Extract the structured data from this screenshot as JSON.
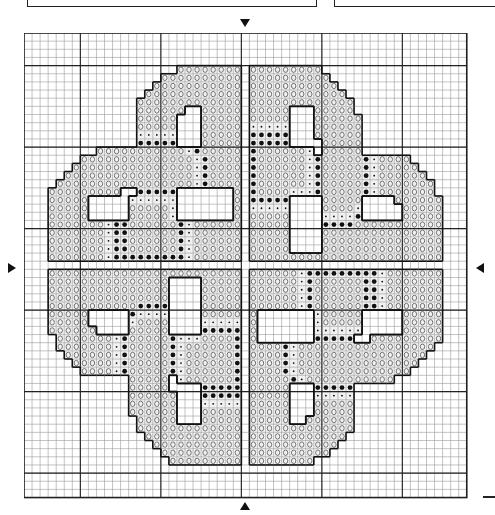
{
  "pattern": {
    "title": "",
    "grid": {
      "cols": 55,
      "rows": 57,
      "cell_w": 8.05,
      "cell_h": 8.15,
      "major_every": 10,
      "major_offset_col": 7,
      "major_offset_row": 4
    },
    "colors": {
      "ink": "#111111",
      "minor_line": "#9a9a9a",
      "major_line": "#222222",
      "fill": "#ffffff"
    },
    "symbols": {
      "o": "light-stitch-circle",
      "s": "small-dot-stitch",
      "b": "large-dot-stitch",
      "w": "outlined-empty-cell"
    },
    "center_markers": [
      "top-arrow",
      "bottom-arrow",
      "left-arrow",
      "right-arrow"
    ],
    "quadrant_rows": [
      "...........................",
      "...........................",
      "...........................",
      "...........................",
      "...................oooooooo",
      ".................oooooooooo",
      "................ooooooooooo",
      "...............oooooooooooo",
      "..............ooooooooooooo",
      "..............oooooowwooooo",
      "..............ooooowwwooooo",
      "..............ooooowwwooooo",
      "..............ssssswwwooooo",
      "..............bbbbbwwwooooo",
      ".........ooooooooooosbooooo",
      ".......oooooooooooooosbooooo",
      "......ooooooooooooooosbooooo",
      ".....oooooooooooooooosbooooo",
      "....ooooooooooooooooosbooooo",
      "...ooooooooowwbbbbbwwwwwwwo",
      "...ooooowwwwwsssssswwwwwwwo",
      "...ooooowwwwwoooooswwwwwwwo",
      "...ooooowwwwwoooooswwwwwwwo",
      "...ooooooosbboooooobsoooooo",
      "...ooooooosbboooooobsoooooo",
      "...ooooooosbboooooobsoooooo",
      "...ooooooosbboooooobsoooooo",
      "...ooooooosbbbbbbbbbsoooooo"
    ]
  }
}
